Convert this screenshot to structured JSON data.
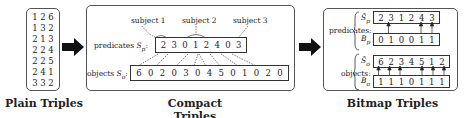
{
  "plain": {
    "caption": "Plain Triples",
    "rows": [
      [
        "1",
        "2",
        "6"
      ],
      [
        "1",
        "3",
        "2"
      ],
      [
        "2",
        "1",
        "3"
      ],
      [
        "2",
        "2",
        "4"
      ],
      [
        "2",
        "2",
        "5"
      ],
      [
        "2",
        "4",
        "1"
      ],
      [
        "3",
        "3",
        "2"
      ]
    ]
  },
  "compact": {
    "caption": "Compact Triples",
    "subject_labels": [
      "subject 1",
      "subject 2",
      "subject 3"
    ],
    "predicates_label": "predicates",
    "predicates_symbol": "S",
    "predicates_sub": "p",
    "objects_label": "objects",
    "objects_symbol": "S",
    "objects_sub": "o",
    "predicates": [
      "2",
      "3",
      "0",
      "1",
      "2",
      "4",
      "0",
      "3"
    ],
    "objects": [
      "6",
      "0",
      "2",
      "0",
      "3",
      "0",
      "4",
      "5",
      "0",
      "1",
      "0",
      "2",
      "0"
    ]
  },
  "bitmap": {
    "caption": "Bitmap Triples",
    "predicates_label": "predicates:",
    "objects_label": "objects:",
    "sp_symbol": "Ŝ",
    "sp_sub": "p",
    "bp_symbol": "B",
    "bp_sub": "p",
    "so_symbol": "Ŝ",
    "so_sub": "o",
    "bo_symbol": "B",
    "bo_sub": "o",
    "sp": [
      "2",
      "3",
      "1",
      "2",
      "4",
      "3"
    ],
    "bp": [
      "0",
      "1",
      "0",
      "0",
      "1",
      "1"
    ],
    "so": [
      "6",
      "2",
      "3",
      "4",
      "5",
      "1",
      "2"
    ],
    "bo": [
      "1",
      "1",
      "1",
      "0",
      "1",
      "1",
      "1"
    ]
  }
}
